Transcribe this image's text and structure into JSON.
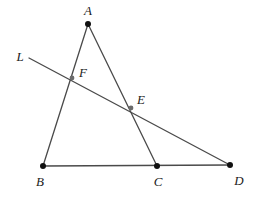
{
  "figure": {
    "width": 256,
    "height": 198,
    "background_color": "#ffffff",
    "stroke_color": "#4a4a4a",
    "vertex_dot_color": "#111111",
    "intersection_dot_color": "#6b6b6b",
    "label_color": "#1b1b1b",
    "stroke_width": 1.3
  },
  "points": [
    {
      "id": "A",
      "label": "A",
      "x": 88,
      "y": 24,
      "label_x": 88,
      "label_y": 10,
      "marker": "vertex-dot",
      "radius": 3.0
    },
    {
      "id": "B",
      "label": "B",
      "x": 43,
      "y": 166,
      "label_x": 40,
      "label_y": 181,
      "marker": "vertex-dot",
      "radius": 3.0
    },
    {
      "id": "C",
      "label": "C",
      "x": 157,
      "y": 166,
      "label_x": 158,
      "label_y": 181,
      "marker": "vertex-dot",
      "radius": 3.0
    },
    {
      "id": "D",
      "label": "D",
      "x": 230,
      "y": 165,
      "label_x": 239,
      "label_y": 180,
      "marker": "vertex-dot",
      "radius": 3.0
    },
    {
      "id": "E",
      "label": "E",
      "x": 131,
      "y": 108,
      "label_x": 141,
      "label_y": 99,
      "marker": "intersection-dot",
      "radius": 2.4
    },
    {
      "id": "F",
      "label": "F",
      "x": 72,
      "y": 78,
      "label_x": 83,
      "label_y": 72,
      "marker": "intersection-dot",
      "radius": 2.4
    }
  ],
  "segments": [
    {
      "id": "AB",
      "name": "segment-ab",
      "from": "A",
      "to": "B",
      "x1": 88,
      "y1": 24,
      "x2": 43,
      "y2": 166
    },
    {
      "id": "AC",
      "name": "segment-ac",
      "from": "A",
      "to": "C",
      "x1": 88,
      "y1": 24,
      "x2": 157,
      "y2": 166
    },
    {
      "id": "BD",
      "name": "segment-bd",
      "from": "B",
      "to": "D",
      "x1": 43,
      "y1": 166,
      "x2": 230,
      "y2": 165
    },
    {
      "id": "L",
      "name": "transversal-line-l",
      "from": "L-start",
      "to": "D",
      "x1": 29,
      "y1": 58,
      "x2": 230,
      "y2": 165
    }
  ],
  "line_labels": [
    {
      "id": "L",
      "label": "L",
      "label_x": 20,
      "label_y": 56
    }
  ]
}
